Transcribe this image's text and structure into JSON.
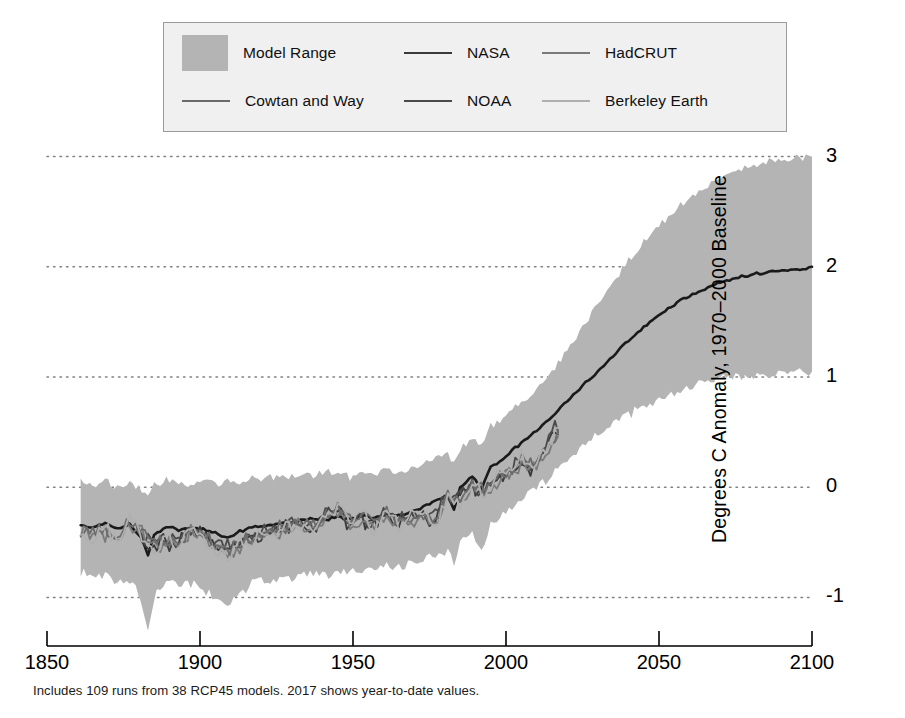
{
  "chart_data": {
    "type": "area",
    "title": "",
    "subtitle": "",
    "xlabel": "",
    "ylabel": "Degrees C Anomaly, 1970–2000 Baseline",
    "caption": "Includes 109 runs from 38 RCP45 models. 2017 shows year-to-date values.",
    "xlim": [
      1850,
      2100
    ],
    "ylim": [
      -1.35,
      3.15
    ],
    "xticks": [
      1850,
      1900,
      1950,
      2000,
      2050,
      2100
    ],
    "xtick_labels": [
      "1850",
      "1900",
      "1950",
      "2000",
      "2050",
      "2100"
    ],
    "yticks": [
      -1,
      0,
      1,
      2,
      3
    ],
    "ytick_labels": [
      "-1",
      "0",
      "1",
      "2",
      "3"
    ],
    "grid": "horizontal-dotted",
    "grid_color": "#808080",
    "legend_position": "top-center",
    "legend_background": "#f0f0f0",
    "legend_border": "#9a9a9a",
    "band": {
      "name": "Model Range",
      "color": "#b4b4b4",
      "description": "Range across 109 CMIP5 RCP4.5 runs from 38 models",
      "x": [
        1861,
        1865,
        1869,
        1873,
        1877,
        1881,
        1883,
        1885,
        1889,
        1893,
        1897,
        1901,
        1905,
        1909,
        1913,
        1917,
        1921,
        1925,
        1929,
        1933,
        1937,
        1941,
        1945,
        1949,
        1953,
        1957,
        1961,
        1965,
        1969,
        1973,
        1977,
        1981,
        1983,
        1985,
        1989,
        1992,
        1995,
        1999,
        2003,
        2007,
        2011,
        2015,
        2017,
        2021,
        2025,
        2029,
        2033,
        2037,
        2041,
        2045,
        2049,
        2053,
        2057,
        2061,
        2065,
        2069,
        2073,
        2077,
        2081,
        2085,
        2089,
        2093,
        2097,
        2100
      ],
      "upper": [
        0.05,
        0.02,
        0.06,
        0.0,
        0.04,
        -0.02,
        -0.06,
        0.03,
        0.08,
        0.05,
        0.02,
        0.08,
        0.04,
        0.07,
        0.03,
        0.1,
        0.06,
        0.11,
        0.08,
        0.13,
        0.1,
        0.15,
        0.12,
        0.1,
        0.14,
        0.11,
        0.16,
        0.13,
        0.18,
        0.22,
        0.28,
        0.3,
        0.2,
        0.35,
        0.45,
        0.38,
        0.55,
        0.62,
        0.72,
        0.8,
        0.92,
        1.05,
        1.12,
        1.28,
        1.45,
        1.62,
        1.78,
        1.94,
        2.08,
        2.22,
        2.35,
        2.46,
        2.56,
        2.65,
        2.72,
        2.79,
        2.84,
        2.88,
        2.91,
        2.94,
        2.96,
        2.98,
        2.99,
        3.0
      ],
      "lower": [
        -0.78,
        -0.82,
        -0.8,
        -0.86,
        -0.84,
        -1.0,
        -1.28,
        -0.95,
        -0.85,
        -0.9,
        -0.88,
        -0.92,
        -0.98,
        -1.05,
        -0.95,
        -0.88,
        -0.86,
        -0.84,
        -0.82,
        -0.8,
        -0.78,
        -0.8,
        -0.76,
        -0.78,
        -0.74,
        -0.76,
        -0.72,
        -0.74,
        -0.7,
        -0.66,
        -0.62,
        -0.58,
        -0.7,
        -0.52,
        -0.44,
        -0.56,
        -0.34,
        -0.26,
        -0.16,
        -0.08,
        0.02,
        0.12,
        0.18,
        0.28,
        0.38,
        0.46,
        0.54,
        0.62,
        0.68,
        0.74,
        0.79,
        0.84,
        0.88,
        0.92,
        0.95,
        0.97,
        0.99,
        1.0,
        1.01,
        1.02,
        1.03,
        1.04,
        1.05,
        1.05
      ]
    },
    "series": [
      {
        "name": "Model Median",
        "color": "#1a1a1a",
        "width": 2.6,
        "in_legend": false,
        "x": [
          1861,
          1865,
          1869,
          1873,
          1877,
          1881,
          1883,
          1885,
          1889,
          1893,
          1897,
          1901,
          1905,
          1909,
          1913,
          1917,
          1921,
          1925,
          1929,
          1933,
          1937,
          1941,
          1945,
          1949,
          1953,
          1957,
          1961,
          1965,
          1969,
          1973,
          1977,
          1981,
          1983,
          1985,
          1989,
          1992,
          1995,
          1999,
          2003,
          2007,
          2011,
          2015,
          2017,
          2021,
          2025,
          2029,
          2033,
          2037,
          2041,
          2045,
          2049,
          2053,
          2057,
          2061,
          2065,
          2069,
          2073,
          2077,
          2081,
          2085,
          2089,
          2093,
          2097,
          2100
        ],
        "values": [
          -0.35,
          -0.36,
          -0.33,
          -0.38,
          -0.34,
          -0.46,
          -0.62,
          -0.44,
          -0.36,
          -0.39,
          -0.37,
          -0.38,
          -0.42,
          -0.46,
          -0.4,
          -0.36,
          -0.35,
          -0.33,
          -0.32,
          -0.3,
          -0.29,
          -0.3,
          -0.27,
          -0.29,
          -0.26,
          -0.28,
          -0.24,
          -0.26,
          -0.22,
          -0.18,
          -0.12,
          -0.08,
          -0.2,
          0.0,
          0.1,
          -0.02,
          0.18,
          0.26,
          0.36,
          0.44,
          0.54,
          0.64,
          0.7,
          0.8,
          0.92,
          1.02,
          1.14,
          1.25,
          1.35,
          1.45,
          1.54,
          1.62,
          1.69,
          1.75,
          1.8,
          1.85,
          1.88,
          1.91,
          1.93,
          1.95,
          1.96,
          1.97,
          1.98,
          2.0
        ]
      },
      {
        "name": "NASA",
        "color": "#3a3a3a",
        "width": 1.8,
        "in_legend": true,
        "x": [
          1880,
          1884,
          1888,
          1892,
          1896,
          1900,
          1904,
          1908,
          1912,
          1916,
          1920,
          1924,
          1928,
          1932,
          1936,
          1940,
          1944,
          1948,
          1952,
          1956,
          1960,
          1964,
          1968,
          1972,
          1976,
          1980,
          1984,
          1988,
          1992,
          1996,
          2000,
          2004,
          2008,
          2012,
          2016,
          2017
        ],
        "values": [
          -0.44,
          -0.56,
          -0.48,
          -0.52,
          -0.38,
          -0.42,
          -0.55,
          -0.58,
          -0.52,
          -0.47,
          -0.44,
          -0.41,
          -0.36,
          -0.33,
          -0.38,
          -0.29,
          -0.21,
          -0.32,
          -0.28,
          -0.36,
          -0.25,
          -0.34,
          -0.31,
          -0.24,
          -0.32,
          -0.1,
          -0.14,
          0.02,
          -0.06,
          0.04,
          0.09,
          0.22,
          0.15,
          0.28,
          0.53,
          0.48
        ]
      },
      {
        "name": "NOAA",
        "color": "#4a4a4a",
        "width": 1.8,
        "in_legend": true,
        "x": [
          1880,
          1884,
          1888,
          1892,
          1896,
          1900,
          1904,
          1908,
          1912,
          1916,
          1920,
          1924,
          1928,
          1932,
          1936,
          1940,
          1944,
          1948,
          1952,
          1956,
          1960,
          1964,
          1968,
          1972,
          1976,
          1980,
          1984,
          1988,
          1992,
          1996,
          2000,
          2004,
          2008,
          2012,
          2016,
          2017
        ],
        "values": [
          -0.4,
          -0.52,
          -0.45,
          -0.49,
          -0.35,
          -0.39,
          -0.52,
          -0.55,
          -0.49,
          -0.44,
          -0.41,
          -0.38,
          -0.34,
          -0.31,
          -0.35,
          -0.26,
          -0.18,
          -0.29,
          -0.25,
          -0.33,
          -0.22,
          -0.31,
          -0.28,
          -0.21,
          -0.29,
          -0.08,
          -0.12,
          0.05,
          -0.03,
          0.07,
          0.12,
          0.24,
          0.18,
          0.3,
          0.55,
          0.5
        ]
      },
      {
        "name": "HadCRUT",
        "color": "#7a7a7a",
        "width": 1.8,
        "in_legend": true,
        "x": [
          1861,
          1865,
          1869,
          1873,
          1877,
          1881,
          1885,
          1889,
          1893,
          1897,
          1901,
          1905,
          1909,
          1913,
          1917,
          1921,
          1925,
          1929,
          1933,
          1937,
          1941,
          1945,
          1949,
          1953,
          1957,
          1961,
          1965,
          1969,
          1973,
          1977,
          1981,
          1985,
          1989,
          1993,
          1997,
          2001,
          2005,
          2009,
          2013,
          2017
        ],
        "values": [
          -0.4,
          -0.45,
          -0.42,
          -0.49,
          -0.33,
          -0.42,
          -0.55,
          -0.5,
          -0.54,
          -0.4,
          -0.44,
          -0.57,
          -0.6,
          -0.54,
          -0.48,
          -0.45,
          -0.42,
          -0.37,
          -0.34,
          -0.39,
          -0.3,
          -0.22,
          -0.33,
          -0.29,
          -0.37,
          -0.26,
          -0.35,
          -0.32,
          -0.25,
          -0.33,
          -0.11,
          -0.15,
          0.01,
          -0.07,
          0.05,
          0.1,
          0.23,
          0.16,
          0.29,
          0.46
        ]
      },
      {
        "name": "Cowtan and Way",
        "color": "#6a6a6a",
        "width": 1.8,
        "in_legend": true,
        "x": [
          1861,
          1865,
          1869,
          1873,
          1877,
          1881,
          1885,
          1889,
          1893,
          1897,
          1901,
          1905,
          1909,
          1913,
          1917,
          1921,
          1925,
          1929,
          1933,
          1937,
          1941,
          1945,
          1949,
          1953,
          1957,
          1961,
          1965,
          1969,
          1973,
          1977,
          1981,
          1985,
          1989,
          1993,
          1997,
          2001,
          2005,
          2009,
          2013,
          2017
        ],
        "values": [
          -0.37,
          -0.42,
          -0.39,
          -0.46,
          -0.3,
          -0.39,
          -0.52,
          -0.47,
          -0.51,
          -0.37,
          -0.41,
          -0.54,
          -0.57,
          -0.51,
          -0.45,
          -0.42,
          -0.39,
          -0.34,
          -0.31,
          -0.36,
          -0.27,
          -0.19,
          -0.3,
          -0.26,
          -0.34,
          -0.23,
          -0.32,
          -0.29,
          -0.22,
          -0.3,
          -0.08,
          -0.12,
          0.04,
          -0.04,
          0.08,
          0.14,
          0.27,
          0.2,
          0.34,
          0.52
        ]
      },
      {
        "name": "Berkeley Earth",
        "color": "#b0b0b0",
        "width": 1.8,
        "in_legend": true,
        "x": [
          1861,
          1865,
          1869,
          1873,
          1877,
          1881,
          1885,
          1889,
          1893,
          1897,
          1901,
          1905,
          1909,
          1913,
          1917,
          1921,
          1925,
          1929,
          1933,
          1937,
          1941,
          1945,
          1949,
          1953,
          1957,
          1961,
          1965,
          1969,
          1973,
          1977,
          1981,
          1985,
          1989,
          1993,
          1997,
          2001,
          2005,
          2009,
          2013,
          2017
        ],
        "values": [
          -0.43,
          -0.48,
          -0.36,
          -0.52,
          -0.26,
          -0.45,
          -0.62,
          -0.44,
          -0.57,
          -0.35,
          -0.47,
          -0.6,
          -0.63,
          -0.5,
          -0.51,
          -0.4,
          -0.44,
          -0.32,
          -0.36,
          -0.42,
          -0.25,
          -0.16,
          -0.36,
          -0.24,
          -0.4,
          -0.2,
          -0.37,
          -0.27,
          -0.19,
          -0.36,
          -0.05,
          -0.17,
          0.06,
          -0.09,
          0.1,
          0.16,
          0.29,
          0.18,
          0.36,
          0.54
        ]
      }
    ]
  },
  "legend": {
    "items": [
      {
        "label": "Model Range",
        "marker": "swatch",
        "color": "#b4b4b4"
      },
      {
        "label": "NASA",
        "marker": "line",
        "color": "#3a3a3a"
      },
      {
        "label": "HadCRUT",
        "marker": "line",
        "color": "#7a7a7a"
      },
      {
        "label": "Cowtan and Way",
        "marker": "line",
        "color": "#6a6a6a"
      },
      {
        "label": "NOAA",
        "marker": "line",
        "color": "#4a4a4a"
      },
      {
        "label": "Berkeley Earth",
        "marker": "line",
        "color": "#b0b0b0"
      }
    ]
  }
}
